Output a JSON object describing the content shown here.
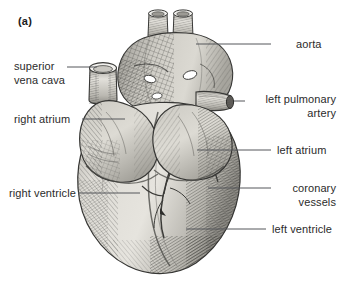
{
  "figure": {
    "panel_tag": "(a)",
    "illustration_style": "engraved-line-hatching",
    "background_color": "#ffffff",
    "leader_line_color": "#55565a",
    "label_text_color": "#2b2b2b"
  },
  "labels": {
    "left": [
      {
        "id": "superior-vena-cava",
        "line1": "superior",
        "line2": "vena cava"
      },
      {
        "id": "right-atrium",
        "line1": "right atrium",
        "line2": ""
      },
      {
        "id": "right-ventricle",
        "line1": "right ventricle",
        "line2": ""
      }
    ],
    "right": [
      {
        "id": "aorta",
        "line1": "aorta",
        "line2": ""
      },
      {
        "id": "left-pulmonary-artery",
        "line1": "left pulmonary",
        "line2": "artery"
      },
      {
        "id": "left-atrium",
        "line1": "left atrium",
        "line2": ""
      },
      {
        "id": "coronary-vessels",
        "line1": "coronary",
        "line2": "vessels"
      },
      {
        "id": "left-ventricle",
        "line1": "left ventricle",
        "line2": ""
      }
    ]
  },
  "anatomy": {
    "aorta": "aorta",
    "superior_vena_cava": "superior vena cava",
    "left_pulmonary_artery": "left pulmonary artery",
    "right_atrium": "right atrium",
    "left_atrium": "left atrium",
    "right_ventricle": "right ventricle",
    "left_ventricle": "left ventricle",
    "coronary_vessels": "coronary vessels"
  },
  "palette": {
    "tissue_light": "#dedcd6",
    "tissue_mid": "#c2c0ba",
    "tissue_dark": "#9a9892",
    "hatch_dark": "#4a4a48",
    "outline": "#3a3a38",
    "vessel_lumen": "#f2f1ee"
  }
}
